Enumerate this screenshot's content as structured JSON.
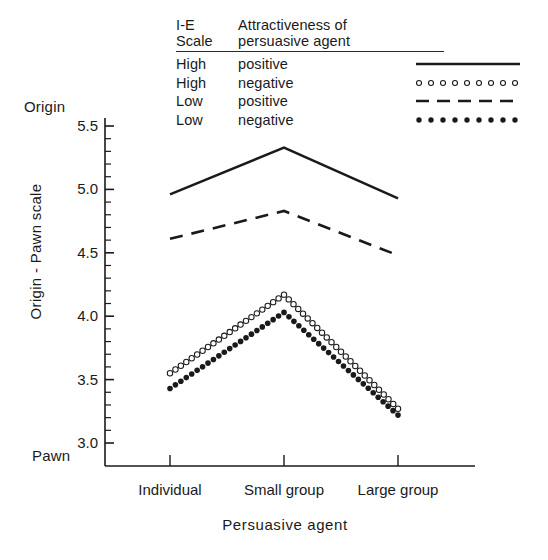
{
  "legend": {
    "header": {
      "col1": "I-E\nScale",
      "col1_line1": "I-E",
      "col1_line2": "Scale",
      "col2_line1": "Attractiveness of",
      "col2_line2": "persuasive agent"
    },
    "rows": [
      {
        "scale": "High",
        "attractiveness": "positive",
        "style": "solid",
        "key": "solid-line-key"
      },
      {
        "scale": "High",
        "attractiveness": "negative",
        "style": "open-circle",
        "key": "open-circle-line-key"
      },
      {
        "scale": "Low",
        "attractiveness": "positive",
        "style": "dashed",
        "key": "dashed-line-key"
      },
      {
        "scale": "Low",
        "attractiveness": "negative",
        "style": "filled-circle",
        "key": "filled-circle-line-key"
      }
    ]
  },
  "axes": {
    "y_top_anchor": "Origin",
    "y_bottom_anchor": "Pawn",
    "ylabel": "Origin - Pawn scale",
    "xlabel": "Persuasive agent",
    "ytick_labels": [
      "5.5",
      "5.0",
      "4.5",
      "4.0",
      "3.5",
      "3.0"
    ],
    "xtick_labels": [
      "Individual",
      "Small group",
      "Large group"
    ]
  },
  "chart_data": {
    "type": "line",
    "title": "",
    "xlabel": "Persuasive agent",
    "ylabel": "Origin - Pawn scale",
    "categories": [
      "Individual",
      "Small group",
      "Large group"
    ],
    "ylim": [
      2.95,
      5.62
    ],
    "yticks": [
      3.0,
      3.5,
      4.0,
      4.5,
      5.0,
      5.5
    ],
    "yminor_step": 0.1,
    "ytop_annotation": "Origin",
    "ybottom_annotation": "Pawn",
    "grid": false,
    "legend_position": "top-right",
    "series": [
      {
        "name": "High I-E / positive attractiveness",
        "style": "solid",
        "values": [
          4.96,
          5.33,
          4.93
        ]
      },
      {
        "name": "High I-E / negative attractiveness",
        "style": "open-circle",
        "values": [
          3.55,
          4.17,
          3.27
        ]
      },
      {
        "name": "Low I-E / positive attractiveness",
        "style": "dashed",
        "values": [
          4.61,
          4.83,
          4.48
        ]
      },
      {
        "name": "Low I-E / negative attractiveness",
        "style": "filled-circle",
        "values": [
          3.43,
          4.03,
          3.22
        ]
      }
    ]
  }
}
